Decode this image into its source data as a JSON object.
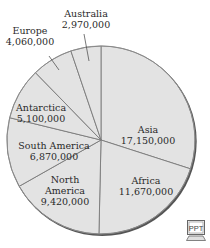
{
  "chart_data": {
    "type": "pie",
    "title": "",
    "start_angle_deg": 0,
    "direction": "clockwise",
    "categories": [
      "Asia",
      "Africa",
      "North America",
      "South America",
      "Antarctica",
      "Europe",
      "Australia"
    ],
    "values": [
      17150000,
      11670000,
      9420000,
      6870000,
      5100000,
      4060000,
      2970000
    ],
    "value_labels": [
      "17,150,000",
      "11,670,000",
      "9,420,000",
      "6,870,000",
      "5,100,000",
      "4,060,000",
      "2,970,000"
    ],
    "label_lines": [
      [
        "Asia",
        "17,150,000"
      ],
      [
        "Africa",
        "11,670,000"
      ],
      [
        "North",
        "America",
        "9,420,000"
      ],
      [
        "South America",
        "6,870,000"
      ],
      [
        "Antarctica",
        "5,100,000"
      ],
      [
        "Europe",
        "4,060,000"
      ],
      [
        "Australia",
        "2,970,000"
      ]
    ],
    "label_positions": [
      [
        148,
        124
      ],
      [
        146,
        175
      ],
      [
        65,
        174
      ],
      [
        54,
        140
      ],
      [
        41,
        102
      ],
      [
        30,
        25
      ],
      [
        86,
        8
      ]
    ],
    "outside_labels": [
      "Europe",
      "Australia"
    ],
    "pointer_lines": [
      {
        "category": "Europe",
        "from": [
          49,
          56
        ],
        "to": [
          59,
          70
        ]
      },
      {
        "category": "Australia",
        "from": [
          84,
          34
        ],
        "to": [
          89,
          61
        ]
      }
    ],
    "colors": {
      "fill": "#e3e3e3",
      "divider": "#7a7a7a",
      "rim": "#555555",
      "text": "#2a2a2a"
    },
    "center": [
      101,
      140
    ],
    "radius": 94
  },
  "badge": {
    "label": "PPT"
  }
}
